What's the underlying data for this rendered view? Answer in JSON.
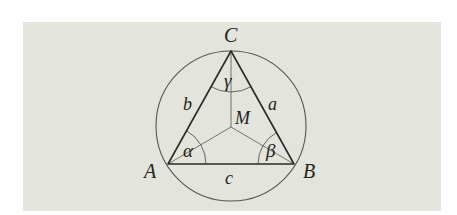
{
  "diagram": {
    "background_color": "#e3e4db",
    "stroke_color": "#333333",
    "circumcircle": {
      "center": [
        231,
        126
      ],
      "radius": 75
    },
    "vertices": [
      {
        "id": "A",
        "label": "A",
        "point": [
          168,
          164
        ],
        "label_pos": [
          148,
          178
        ]
      },
      {
        "id": "B",
        "label": "B",
        "point": [
          294,
          164
        ],
        "label_pos": [
          307,
          178
        ]
      },
      {
        "id": "C",
        "label": "C",
        "point": [
          231,
          51
        ],
        "label_pos": [
          224,
          42
        ]
      }
    ],
    "center": {
      "id": "M",
      "label": "M",
      "point": [
        231,
        127
      ],
      "label_pos": [
        237,
        124
      ]
    },
    "sides": [
      {
        "id": "a",
        "label": "a",
        "between": [
          "B",
          "C"
        ],
        "label_pos": [
          269,
          110
        ]
      },
      {
        "id": "b",
        "label": "b",
        "between": [
          "A",
          "C"
        ],
        "label_pos": [
          184,
          109
        ]
      },
      {
        "id": "c",
        "label": "c",
        "between": [
          "A",
          "B"
        ],
        "label_pos": [
          224,
          184
        ]
      }
    ],
    "angles": [
      {
        "id": "alpha",
        "label": "α",
        "vertex": "A",
        "arc_radius": 38,
        "label_pos": [
          184,
          157
        ]
      },
      {
        "id": "beta",
        "label": "β",
        "vertex": "B",
        "arc_radius": 36,
        "label_pos": [
          266,
          157
        ]
      },
      {
        "id": "gamma",
        "label": "γ",
        "vertex": "C",
        "arc_radius": 41,
        "label_pos": [
          224,
          86
        ]
      }
    ]
  }
}
